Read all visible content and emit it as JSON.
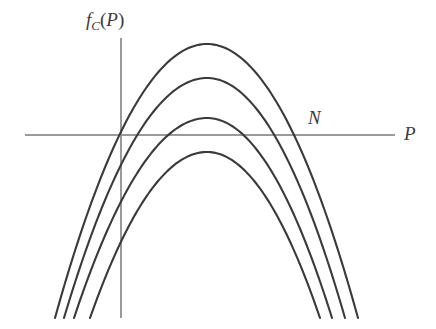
{
  "figure": {
    "kind": "mathematical-plot",
    "background_color": "#ffffff",
    "curve_color": "#3a3a3a",
    "axis_color": "#9a9a9a",
    "label_color": "#3c3c3c"
  },
  "labels": {
    "y_axis": {
      "full": "fC(P)",
      "base": "f",
      "subscript": "C",
      "argument": "(P)",
      "open_paren": "(",
      "variable": "P",
      "close_paren": ")"
    },
    "x_axis": "P",
    "point_n": "N"
  },
  "chart_data": {
    "type": "line",
    "title": "",
    "subtitle": "",
    "xlabel": "P",
    "ylabel": "fC(P)",
    "grid": false,
    "legend": null,
    "annotations": [
      {
        "text": "N",
        "x": 312,
        "y": 120,
        "describes": "point on the horizontal axis where the outermost curve crosses"
      }
    ],
    "axes": {
      "horizontal": {
        "label": "P",
        "y_pixel": 135,
        "x_start_pixel": 25,
        "x_end_pixel": 395,
        "color": "#9a9a9a",
        "width": 1
      },
      "vertical": {
        "label": "fC(P)",
        "x_pixel": 121,
        "y_start_pixel": 38,
        "y_end_pixel": 318,
        "color": "#9a9a9a",
        "width": 1
      },
      "origin_pixel": {
        "x": 121,
        "y": 135
      }
    },
    "series": [
      {
        "name": "curve-1",
        "description": "outermost / highest downward parabola",
        "peak": {
          "x": 207,
          "y": 44
        },
        "x_axis_crossings": [
          105,
          305
        ],
        "left_endpoint": {
          "x": 55,
          "y": 318
        },
        "right_endpoint": {
          "x": 358,
          "y": 318
        }
      },
      {
        "name": "curve-2",
        "description": "second downward parabola",
        "peak": {
          "x": 207,
          "y": 78
        },
        "x_axis_crossings": [
          122,
          293
        ],
        "left_endpoint": {
          "x": 64,
          "y": 318
        },
        "right_endpoint": {
          "x": 345,
          "y": 318
        }
      },
      {
        "name": "curve-3",
        "description": "third downward parabola",
        "peak": {
          "x": 207,
          "y": 118
        },
        "x_axis_crossings": [
          142,
          272
        ],
        "left_endpoint": {
          "x": 74,
          "y": 318
        },
        "right_endpoint": {
          "x": 332,
          "y": 318
        }
      },
      {
        "name": "curve-4",
        "description": "innermost / lowest downward parabola, peak below the axis",
        "peak": {
          "x": 207,
          "y": 152
        },
        "x_axis_crossings": [],
        "left_endpoint": {
          "x": 90,
          "y": 318
        },
        "right_endpoint": {
          "x": 320,
          "y": 318
        }
      }
    ]
  }
}
